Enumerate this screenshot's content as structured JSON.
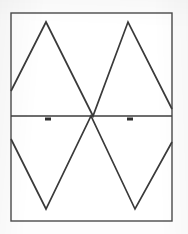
{
  "figure": {
    "background_color": "#fdfdfd",
    "frame": {
      "name": "plot-border",
      "stroke_color": "#4a4a4a",
      "stroke_width": 1.4,
      "x": 11,
      "y": 13,
      "width": 161,
      "height": 208
    },
    "axis": {
      "name": "zero-level-axis",
      "label": "0 V",
      "y": 116,
      "x_start": 11,
      "x_end": 172,
      "stroke_color": "#3d3d3d",
      "stroke_width": 1.6
    },
    "markers": [
      {
        "name": "cursor-marker-left",
        "x": 48,
        "y": 119,
        "width": 6,
        "height": 3,
        "color": "#2e2e2e"
      },
      {
        "name": "cursor-marker-right",
        "x": 130,
        "y": 119,
        "width": 6,
        "height": 3,
        "color": "#2e2e2e"
      }
    ]
  },
  "chart_data": {
    "type": "line",
    "subtitle": "",
    "xlabel": "",
    "ylabel": "",
    "xlim": [
      0,
      161
    ],
    "ylim": [
      -1,
      1
    ],
    "grid": false,
    "legend": "none",
    "annotations": [
      {
        "label": "0 V",
        "type": "axis-line",
        "y": 0
      },
      {
        "label": "cursor 1",
        "type": "marker",
        "x": 37,
        "y": 0
      },
      {
        "label": "cursor 2",
        "type": "marker",
        "x": 119,
        "y": 0
      }
    ],
    "series": [
      {
        "name": "Channel 1 triangle (rising phase)",
        "color": "#3a3a3a",
        "stroke_width": 1.7,
        "points_px": [
          [
            11,
            91
          ],
          [
            46,
            22
          ],
          [
            93,
            116
          ],
          [
            128,
            22
          ],
          [
            172,
            109
          ]
        ]
      },
      {
        "name": "Channel 2 triangle (falling phase)",
        "color": "#3a3a3a",
        "stroke_width": 1.7,
        "points_px": [
          [
            11,
            139
          ],
          [
            46,
            209
          ],
          [
            91,
            116
          ],
          [
            135,
            209
          ],
          [
            172,
            142
          ]
        ]
      }
    ]
  }
}
